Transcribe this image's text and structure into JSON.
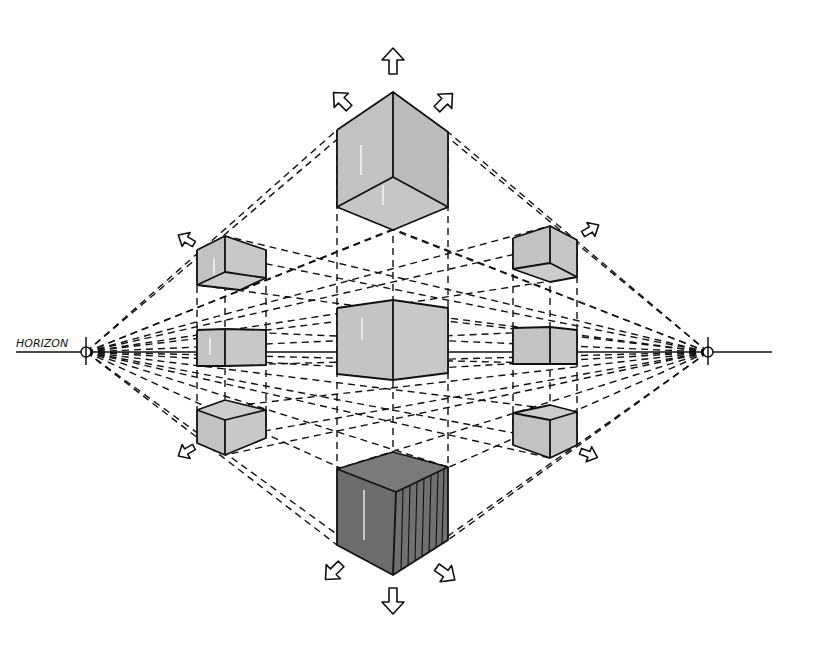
{
  "diagram": {
    "horizon_label": "HORIZON",
    "vanishing_points": [
      {
        "name": "left",
        "x": 86,
        "y": 352
      },
      {
        "name": "right",
        "x": 708,
        "y": 352
      }
    ],
    "horizon_y": 352,
    "colors": {
      "light_face": "#c4c4c4",
      "mid_face": "#b2b2b2",
      "dark_face": "#6f6f6f",
      "line": "#111111",
      "background": "#ffffff"
    },
    "cubes": [
      {
        "id": "top-center",
        "position": "above horizon",
        "shade": "light",
        "view": "bottom visible"
      },
      {
        "id": "upper-left",
        "position": "above horizon",
        "shade": "light",
        "view": "bottom visible"
      },
      {
        "id": "upper-right",
        "position": "above horizon",
        "shade": "light",
        "view": "bottom visible"
      },
      {
        "id": "middle-left",
        "position": "on horizon",
        "shade": "light",
        "view": "sides only"
      },
      {
        "id": "center",
        "position": "on horizon",
        "shade": "light",
        "view": "sides only"
      },
      {
        "id": "middle-right",
        "position": "on horizon",
        "shade": "light",
        "view": "sides only"
      },
      {
        "id": "lower-left",
        "position": "below horizon",
        "shade": "light",
        "view": "top visible"
      },
      {
        "id": "lower-right",
        "position": "below horizon",
        "shade": "light",
        "view": "top visible"
      },
      {
        "id": "bottom-center",
        "position": "below horizon",
        "shade": "dark",
        "view": "top visible"
      }
    ],
    "arrows": [
      "up",
      "up-left",
      "up-right",
      "left-upper",
      "right-upper",
      "left-lower",
      "right-lower",
      "down",
      "down-left",
      "down-right"
    ]
  }
}
